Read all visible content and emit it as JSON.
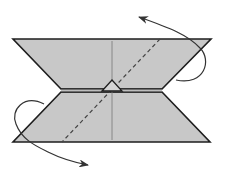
{
  "diagram": {
    "type": "origami-fold-step",
    "colors": {
      "paper": "#c8c8c8",
      "outline": "#1e1e1e",
      "crease": "#555555",
      "arrow": "#333333",
      "background": "#ffffff"
    },
    "elements": {
      "paper_shape": "hourglass / bow-tie folded paper",
      "valley_fold_line": "diagonal dashed line",
      "center_crease": "vertical crease line",
      "center_marker": "small triangle flap at center",
      "arrow_top_right": "curved arrow folding behind at upper right",
      "arrow_bottom_left": "curved arrow folding behind at lower left"
    }
  }
}
